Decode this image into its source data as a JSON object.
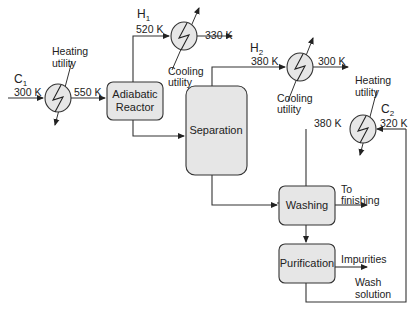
{
  "streams": {
    "c1": {
      "name": "C",
      "sub": "1",
      "in_temp": "300 K",
      "out_temp": "550 K"
    },
    "h1": {
      "name": "H",
      "sub": "1",
      "in_temp": "520 K",
      "out_temp": "330 K"
    },
    "h2": {
      "name": "H",
      "sub": "2",
      "in_temp": "380 K",
      "out_temp": "300 K"
    },
    "c2": {
      "name": "C",
      "sub": "2",
      "in_temp": "320 K",
      "out_temp": "380 K"
    }
  },
  "utilities": {
    "heating_1": [
      "Heating",
      "utility"
    ],
    "cooling_1": [
      "Cooling",
      "utility"
    ],
    "cooling_2": [
      "Cooling",
      "utility"
    ],
    "heating_2": [
      "Heating",
      "utility"
    ]
  },
  "units": {
    "reactor": [
      "Adiabatic",
      "Reactor"
    ],
    "separation": "Separation",
    "washing": "Washing",
    "purification": "Purification"
  },
  "outlets": {
    "to_finishing": [
      "To",
      "finishing"
    ],
    "impurities": "Impurities",
    "wash_solution": [
      "Wash",
      "solution"
    ]
  }
}
